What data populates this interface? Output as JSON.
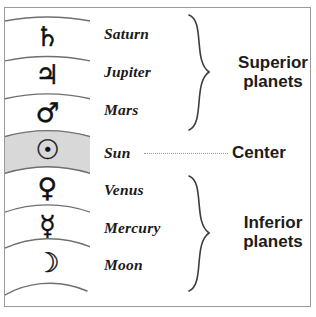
{
  "figure": {
    "rows": [
      {
        "symbol": "♄",
        "icon_name": "saturn-symbol-icon",
        "name": "Saturn"
      },
      {
        "symbol": "♃",
        "icon_name": "jupiter-symbol-icon",
        "name": "Jupiter"
      },
      {
        "symbol": "♂",
        "icon_name": "mars-symbol-icon",
        "name": "Mars"
      },
      {
        "symbol": "☉",
        "icon_name": "sun-symbol-icon",
        "name": "Sun"
      },
      {
        "symbol": "♀",
        "icon_name": "venus-symbol-icon",
        "name": "Venus"
      },
      {
        "symbol": "☿",
        "icon_name": "mercury-symbol-icon",
        "name": "Mercury"
      },
      {
        "symbol": "☽",
        "icon_name": "moon-symbol-icon",
        "name": "Moon"
      }
    ],
    "groups": {
      "superior": "Superior\nplanets",
      "center": "Center",
      "inferior": "Inferior\nplanets"
    },
    "colors": {
      "highlight_row": "#d8d8d8",
      "arc_line": "#6f6f6f",
      "border": "#9a9a9a",
      "text": "#1c1c1c",
      "leader": "#9b9b9b"
    }
  }
}
